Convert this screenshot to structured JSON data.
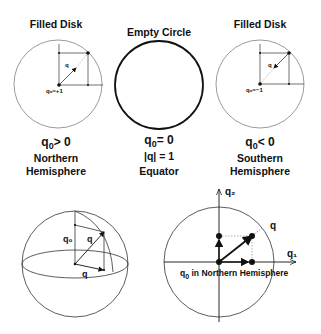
{
  "panels": {
    "north": {
      "title": "Filled Disk",
      "point_label": "q₀=+1",
      "vector_label": "q",
      "eq_var": "q",
      "eq_sub": "0",
      "eq_rel": "> 0",
      "line1": "Northern",
      "line2": "Hemisphere"
    },
    "equator": {
      "title": "Empty Circle",
      "eq_var": "q",
      "eq_sub": "0",
      "eq_rel": "= 0",
      "norm": "|q| = 1",
      "line1": "Equator"
    },
    "south": {
      "title": "Filled Disk",
      "point_label": "q₀=−1",
      "vector_label": "q",
      "eq_var": "q",
      "eq_sub": "0",
      "eq_rel": "< 0",
      "line1": "Southern",
      "line2": "Hemisphere"
    }
  },
  "sphere": {
    "q0_label": "q₀",
    "q_label": "q",
    "qvec_label": "q"
  },
  "plane": {
    "axis_x": "q₁",
    "axis_y": "q₂",
    "vector_label": "q",
    "caption_var": "q",
    "caption_sub": "0",
    "caption_rest": " in Northern Hemisphere"
  }
}
